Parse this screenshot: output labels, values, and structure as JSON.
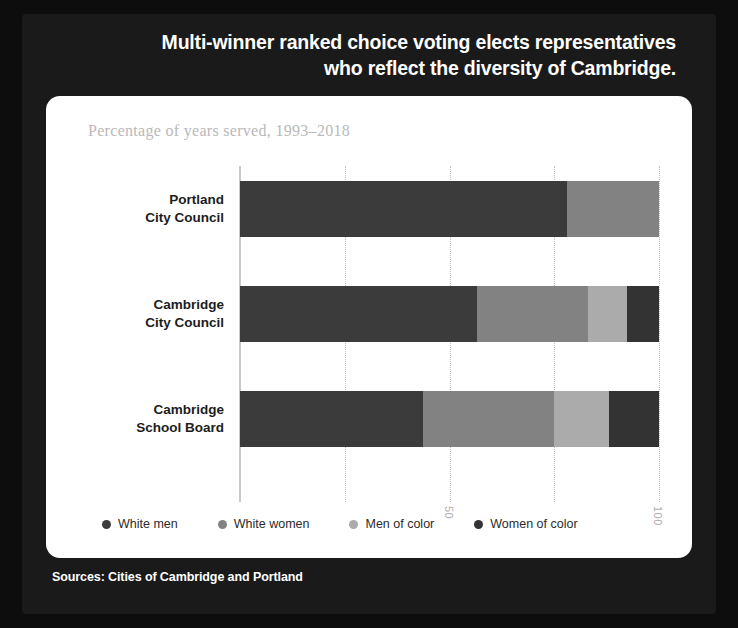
{
  "headline": {
    "line1": "Multi-winner ranked choice voting elects representatives",
    "line2": "who reflect the diversity of Cambridge."
  },
  "source_note": "Sources: Cities of Cambridge and Portland",
  "chart_data": {
    "type": "bar",
    "orientation": "horizontal",
    "stacked": true,
    "stack_mode": "percent",
    "title": "",
    "subtitle": "Percentage of years served, 1993–2018",
    "xlabel": "",
    "ylabel": "",
    "xlim": [
      0,
      100
    ],
    "xticks": [
      0,
      25,
      50,
      75,
      100
    ],
    "xtick_labels": [
      "",
      "",
      "50",
      "",
      "100"
    ],
    "tick_label_rotation": 90,
    "grid": "vertical-dotted",
    "legend_position": "bottom",
    "categories": [
      "Portland\nCity Council",
      "Cambridge\nCity Council",
      "Cambridge\nSchool Board"
    ],
    "category_lines": [
      [
        "Portland",
        "City Council"
      ],
      [
        "Cambridge",
        "City Council"
      ],
      [
        "Cambridge",
        "School Board"
      ]
    ],
    "series": [
      {
        "name": "White men",
        "color": "#3b3b3b",
        "values": [
          78.0,
          56.6,
          43.7
        ]
      },
      {
        "name": "White women",
        "color": "#828282",
        "values": [
          22.0,
          26.5,
          31.3
        ]
      },
      {
        "name": "Men of color",
        "color": "#ababab",
        "values": [
          0.0,
          9.3,
          13.1
        ]
      },
      {
        "name": "Women of color",
        "color": "#333333",
        "values": [
          0.0,
          7.6,
          11.9
        ]
      }
    ]
  },
  "colors": {
    "poster_background": "#1a1a1a",
    "card_background": "#ffffff",
    "headline_text": "#ffffff",
    "subtitle_text": "#b9b9b9",
    "axis": "#c9c9c9"
  }
}
